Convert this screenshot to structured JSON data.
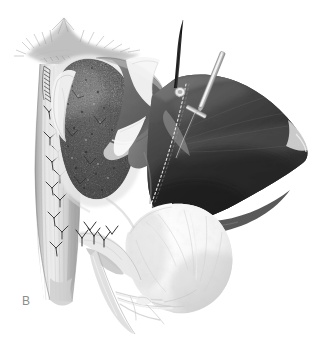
{
  "figure": {
    "panel_label": "B",
    "caption_visible": false,
    "background_color": "#ffffff",
    "width": 324,
    "height": 346,
    "style": "grayscale medical line-and-tone surgical illustration"
  },
  "palette": {
    "background": "#ffffff",
    "flap_dark": "#3a3a3a",
    "flap_dark_deep": "#2b2b2b",
    "flap_mid": "#6e6e6e",
    "graft_base": "#6a6a6a",
    "graft_speckle_dark": "#2e2e2e",
    "graft_speckle_light": "#b4b4b4",
    "tube_light": "#c5c5c5",
    "tube_shadow": "#9a9a9a",
    "tube_highlight": "#ededed",
    "bone_white": "#fbfbfb",
    "bone_shade": "#dcdcdc",
    "frayed_tissue": "#bfbfbf",
    "suture_thread": "#2a2a2a",
    "needle_dark": "#1f1f1f",
    "metal_pin_light": "#d8d8d8",
    "metal_pin_shadow": "#8e8e8e",
    "dotted_line": "#f2f2f2",
    "label_gray": "#8c8c8c"
  },
  "elements": {
    "frayed_tissue_top": {
      "name": "frayed-tissue-top",
      "description": "Ragged, feathered soft-tissue edge at the top of the field"
    },
    "tubular_structure": {
      "name": "tubular-structure",
      "description": "Vertical light-gray tubular tendon/muscle running down the left side"
    },
    "suture_row": {
      "name": "suture-row",
      "description": "Column of interrupted Y-shaped suture knots along the tubular structure",
      "knot_count": 11
    },
    "running_suture_top": {
      "name": "running-suture-top",
      "description": "Fine running/whip stitch at the upper end of the tubular structure"
    },
    "bone_graft": {
      "name": "bone-graft",
      "description": "Stippled cancellous bone graft block packed over the repair site"
    },
    "soft_tissue_flap_upper": {
      "name": "soft-tissue-flap-upper",
      "description": "Mid-gray curved soft-tissue flap folded over the top of the graft"
    },
    "soft_tissue_flap_dark": {
      "name": "soft-tissue-flap-dark",
      "description": "Large dark fan-shaped retracted flap occupying the right half"
    },
    "dotted_incision_line": {
      "name": "dotted-incision-line",
      "description": "Dotted planned incision / suture line crossing the dark flap"
    },
    "bone_condyle": {
      "name": "bone-condyle",
      "description": "Bright white rounded bone/condyle exposed beneath the dark flap"
    },
    "suture_needle": {
      "name": "suture-needle",
      "description": "Dark curved suture needle entering the flap at upper center-right"
    },
    "metal_guide_pin": {
      "name": "metal-guide-pin",
      "description": "Light metallic guide pin / K-wire angled across the upper right flap"
    },
    "suture_cluster_lower": {
      "name": "suture-cluster-lower",
      "description": "Cluster of suture knots at the lower junction of the tube and graft"
    },
    "vessel_strands": {
      "name": "vessel-strands",
      "description": "Thin white vessel/fascia strands fanning out at the bottom"
    }
  }
}
